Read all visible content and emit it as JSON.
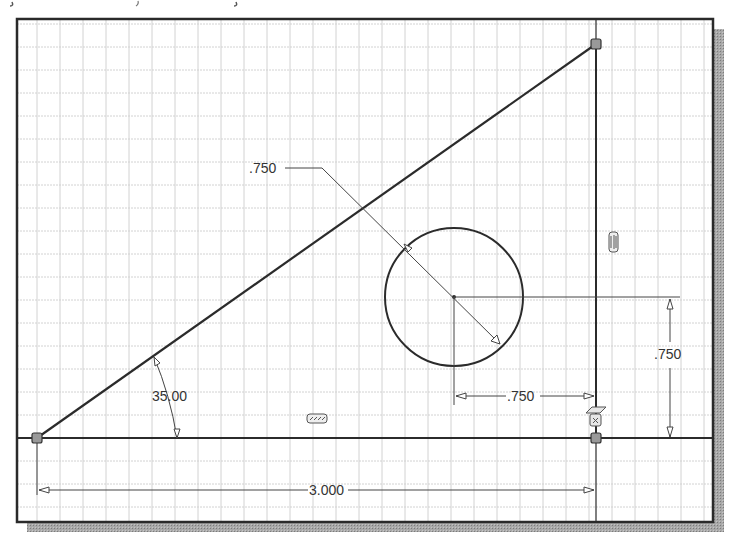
{
  "canvas": {
    "background": "#ffffff",
    "frame_color": "#2a2a2a",
    "shadow_color": "#9a9a9a",
    "grid_color": "#cfcfcf",
    "grid_spacing_px": 23,
    "geometry_color": "#2b2b2b",
    "dimension_color": "#3a3a3a"
  },
  "sketch": {
    "vertices": [
      {
        "name": "bottom-left-point",
        "x": 37,
        "y": 438
      },
      {
        "name": "top-right-point",
        "x": 596,
        "y": 44
      },
      {
        "name": "bottom-right-point",
        "x": 596,
        "y": 438
      }
    ],
    "circle": {
      "cx": 454,
      "cy": 297,
      "r": 69
    }
  },
  "dimensions": {
    "diameter": {
      "label": ".750"
    },
    "angle": {
      "label": "35.00"
    },
    "horizontal_offset": {
      "label": ".750"
    },
    "vertical_offset": {
      "label": ".750"
    },
    "base_length": {
      "label": "3.000"
    }
  },
  "constraints": [
    {
      "type": "vertical",
      "icon": "vertical-constraint-icon"
    },
    {
      "type": "horizontal",
      "icon": "horizontal-constraint-icon"
    },
    {
      "type": "coincident-fix",
      "icon": "fix-constraint-icon"
    }
  ]
}
